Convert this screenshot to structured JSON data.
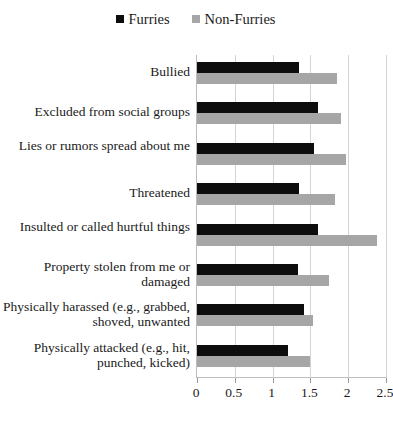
{
  "chart_data": {
    "type": "bar",
    "orientation": "horizontal",
    "title": "",
    "xlabel": "",
    "ylabel": "",
    "xlim": [
      0,
      2.5
    ],
    "xticks": [
      "0",
      "0.5",
      "1",
      "1.5",
      "2",
      "2.5"
    ],
    "grid": true,
    "legend_position": "top-center",
    "categories": [
      "Bullied",
      "Excluded from social groups",
      "Lies or rumors spread about me",
      "Threatened",
      "Insulted or called hurtful things",
      "Property stolen from me or damaged",
      "Physically harassed (e.g., grabbed, shoved, unwanted",
      "Physically attacked (e.g., hit, punched, kicked)"
    ],
    "series": [
      {
        "name": "Furries",
        "color": "#0d0d0d",
        "values": [
          1.35,
          1.6,
          1.55,
          1.35,
          1.6,
          1.33,
          1.42,
          1.2
        ]
      },
      {
        "name": "Non-Furries",
        "color": "#a6a6a6",
        "values": [
          1.85,
          1.9,
          1.97,
          1.82,
          2.38,
          1.75,
          1.53,
          1.5
        ]
      }
    ]
  },
  "legend": {
    "items": [
      {
        "label": "Furries",
        "swatch": "legend-swatch-furries"
      },
      {
        "label": "Non-Furries",
        "swatch": "legend-swatch-nonfurries"
      }
    ]
  }
}
